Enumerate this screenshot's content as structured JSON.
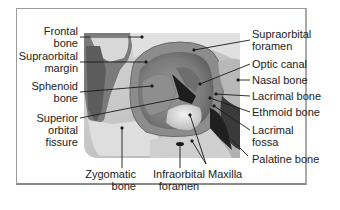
{
  "diagram": {
    "labels_left": [
      {
        "id": "frontal-bone",
        "lines": [
          "Frontal",
          "bone"
        ]
      },
      {
        "id": "supraorbital-margin",
        "lines": [
          "Supraorbital",
          "margin"
        ]
      },
      {
        "id": "sphenoid-bone",
        "lines": [
          "Sphenoid",
          "bone"
        ]
      },
      {
        "id": "superior-orbital-fissure",
        "lines": [
          "Superior",
          "orbital",
          "fissure"
        ]
      }
    ],
    "labels_bottom": [
      {
        "id": "zygomatic-bone",
        "lines": [
          "Zygomatic",
          "bone"
        ]
      },
      {
        "id": "infraorbital-foramen",
        "lines": [
          "Infraorbital",
          "foramen"
        ]
      },
      {
        "id": "maxilla",
        "lines": [
          "Maxilla"
        ]
      }
    ],
    "labels_right": [
      {
        "id": "supraorbital-foramen",
        "lines": [
          "Supraorbital",
          "foramen"
        ]
      },
      {
        "id": "optic-canal",
        "lines": [
          "Optic canal"
        ]
      },
      {
        "id": "nasal-bone",
        "lines": [
          "Nasal bone"
        ]
      },
      {
        "id": "lacrimal-bone",
        "lines": [
          "Lacrimal bone"
        ]
      },
      {
        "id": "ethmoid-bone",
        "lines": [
          "Ethmoid bone"
        ]
      },
      {
        "id": "lacrimal-fossa",
        "lines": [
          "Lacrimal",
          "fossa"
        ]
      },
      {
        "id": "palatine-bone",
        "lines": [
          "Palatine bone"
        ]
      }
    ],
    "colors": {
      "frame": "#9a9a9a",
      "leader": "#1a1a1a",
      "text": "#222222",
      "bone_light": "#e6e6e6",
      "bone_mid": "#a8a8a8",
      "bone_dark": "#5a5a5a",
      "shadow": "#1e1e1e"
    }
  }
}
